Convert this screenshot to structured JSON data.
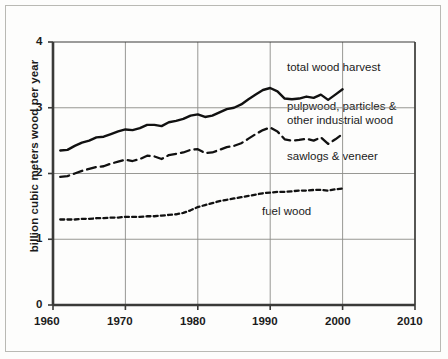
{
  "chart_data": {
    "type": "line",
    "title": "",
    "xlabel": "",
    "ylabel": "billion cubic meters wood per year",
    "xlim": [
      1960,
      2010
    ],
    "ylim": [
      0,
      4
    ],
    "xticks": [
      "1960",
      "1970",
      "1980",
      "1990",
      "2000",
      "2010"
    ],
    "yticks": [
      "0",
      "1",
      "2",
      "3",
      "4"
    ],
    "grid": true,
    "legend_position": "inline-annotations",
    "series": [
      {
        "name": "total wood harvest",
        "style": "solid",
        "label_x": 1990,
        "label_y": 3.62,
        "x": [
          1961,
          1962,
          1963,
          1964,
          1965,
          1966,
          1967,
          1968,
          1969,
          1970,
          1971,
          1972,
          1973,
          1974,
          1975,
          1976,
          1977,
          1978,
          1979,
          1980,
          1981,
          1982,
          1983,
          1984,
          1985,
          1986,
          1987,
          1988,
          1989,
          1990,
          1991,
          1992,
          1993,
          1994,
          1995,
          1996,
          1997,
          1998,
          1999,
          2000
        ],
        "values": [
          2.35,
          2.36,
          2.42,
          2.47,
          2.5,
          2.55,
          2.56,
          2.6,
          2.64,
          2.67,
          2.66,
          2.69,
          2.74,
          2.74,
          2.72,
          2.78,
          2.8,
          2.83,
          2.88,
          2.9,
          2.86,
          2.88,
          2.93,
          2.98,
          3.0,
          3.05,
          3.13,
          3.2,
          3.27,
          3.3,
          3.25,
          3.14,
          3.13,
          3.14,
          3.17,
          3.15,
          3.2,
          3.12,
          3.2,
          3.28
        ]
      },
      {
        "name": "pulpwood, particles & other industrial wood",
        "style": "dashed",
        "label_x": 1990,
        "label_y": 3.07,
        "label_line2_y": 2.87
      },
      {
        "name": "sawlogs & veneer",
        "style": "dashed-series",
        "label_x": 1990,
        "label_y": 2.22,
        "x": [
          1961,
          1962,
          1963,
          1964,
          1965,
          1966,
          1967,
          1968,
          1969,
          1970,
          1971,
          1972,
          1973,
          1974,
          1975,
          1976,
          1977,
          1978,
          1979,
          1980,
          1981,
          1982,
          1983,
          1984,
          1985,
          1986,
          1987,
          1988,
          1989,
          1990,
          1991,
          1992,
          1993,
          1994,
          1995,
          1996,
          1997,
          1998,
          1999,
          2000
        ],
        "values": [
          1.95,
          1.96,
          2.0,
          2.04,
          2.07,
          2.1,
          2.11,
          2.15,
          2.18,
          2.21,
          2.19,
          2.22,
          2.27,
          2.26,
          2.22,
          2.28,
          2.3,
          2.32,
          2.36,
          2.37,
          2.31,
          2.32,
          2.36,
          2.4,
          2.42,
          2.46,
          2.53,
          2.6,
          2.66,
          2.7,
          2.64,
          2.52,
          2.5,
          2.51,
          2.53,
          2.5,
          2.55,
          2.45,
          2.52,
          2.6
        ]
      },
      {
        "name": "fuel wood",
        "style": "dotted",
        "label_x": 1989,
        "label_y": 1.47,
        "x": [
          1961,
          1962,
          1963,
          1964,
          1965,
          1966,
          1967,
          1968,
          1969,
          1970,
          1971,
          1972,
          1973,
          1974,
          1975,
          1976,
          1977,
          1978,
          1979,
          1980,
          1981,
          1982,
          1983,
          1984,
          1985,
          1986,
          1987,
          1988,
          1989,
          1990,
          1991,
          1992,
          1993,
          1994,
          1995,
          1996,
          1997,
          1998,
          1999,
          2000
        ],
        "values": [
          1.3,
          1.3,
          1.3,
          1.31,
          1.31,
          1.32,
          1.32,
          1.33,
          1.33,
          1.34,
          1.34,
          1.34,
          1.35,
          1.35,
          1.36,
          1.37,
          1.38,
          1.4,
          1.44,
          1.49,
          1.52,
          1.55,
          1.58,
          1.6,
          1.62,
          1.64,
          1.66,
          1.68,
          1.7,
          1.71,
          1.72,
          1.72,
          1.73,
          1.74,
          1.74,
          1.75,
          1.75,
          1.74,
          1.76,
          1.77
        ]
      }
    ]
  },
  "labels": {
    "y_axis_title": "billion cubic meters wood per year",
    "total_wood_harvest": "total wood harvest",
    "pulpwood_line1": "pulpwood, particles &",
    "pulpwood_line2": "other industrial wood",
    "sawlogs": "sawlogs & veneer",
    "fuel_wood": "fuel wood",
    "x_tick_1960": "1960",
    "x_tick_1970": "1970",
    "x_tick_1980": "1980",
    "x_tick_1990": "1990",
    "x_tick_2000": "2000",
    "x_tick_2010": "2010",
    "y_tick_0": "0",
    "y_tick_1": "1",
    "y_tick_2": "2",
    "y_tick_3": "3",
    "y_tick_4": "4"
  },
  "colors": {
    "axis": "#3a3a38",
    "grid": "#8c8c88",
    "line": "#111111",
    "frame": "#b9b9b4",
    "background": "#fdfdfc"
  }
}
